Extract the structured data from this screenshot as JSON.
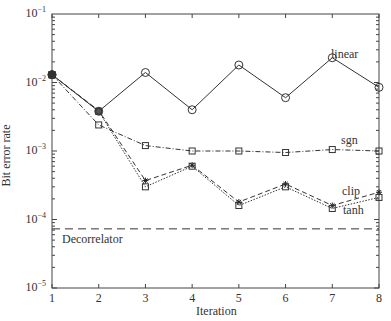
{
  "chart_data": {
    "type": "line",
    "title": "",
    "xlabel": "Iteration",
    "ylabel": "Bit error rate",
    "yscale": "log",
    "xlim": [
      1,
      8
    ],
    "ylim": [
      1e-05,
      0.1
    ],
    "grid": false,
    "legend": "inline labels",
    "x": [
      1,
      2,
      3,
      4,
      5,
      6,
      7,
      8
    ],
    "x_tick_labels": [
      "1",
      "2",
      "3",
      "4",
      "5",
      "6",
      "7",
      "8"
    ],
    "y_tick_labels": [
      {
        "base": "10",
        "exp": "−1",
        "value": 0.1
      },
      {
        "base": "10",
        "exp": "−2",
        "value": 0.01
      },
      {
        "base": "10",
        "exp": "−3",
        "value": 0.001
      },
      {
        "base": "10",
        "exp": "−4",
        "value": 0.0001
      },
      {
        "base": "10",
        "exp": "−5",
        "value": 1e-05
      }
    ],
    "series": [
      {
        "name": "linear",
        "marker": "circle",
        "style": "solid",
        "values": [
          0.013,
          0.0038,
          0.014,
          0.004,
          0.018,
          0.006,
          0.023,
          0.0085
        ]
      },
      {
        "name": "sgn",
        "marker": "square",
        "style": "dashdot",
        "values": [
          0.013,
          0.0024,
          0.0012,
          0.001,
          0.001,
          0.00095,
          0.00105,
          0.001
        ]
      },
      {
        "name": "clip",
        "marker": "star",
        "style": "dashed",
        "values": [
          0.013,
          0.0039,
          0.00037,
          0.00062,
          0.00018,
          0.00033,
          0.00016,
          0.00025
        ]
      },
      {
        "name": "tanh",
        "marker": "square",
        "style": "dotted",
        "values": [
          0.013,
          0.0038,
          0.0003,
          0.0006,
          0.00016,
          0.0003,
          0.000145,
          0.00021
        ]
      },
      {
        "name": "Decorrelator",
        "marker": "none",
        "style": "longdash",
        "values": [
          7.3e-05,
          7.3e-05,
          7.3e-05,
          7.3e-05,
          7.3e-05,
          7.3e-05,
          7.3e-05,
          7.3e-05
        ]
      }
    ],
    "annotations": [
      {
        "text": "linear",
        "series": "linear"
      },
      {
        "text": "sgn",
        "series": "sgn"
      },
      {
        "text": "clip",
        "series": "clip"
      },
      {
        "text": "tanh",
        "series": "tanh"
      },
      {
        "text": "Decorrelator",
        "series": "Decorrelator"
      }
    ]
  },
  "labels": {
    "xlabel": "Iteration",
    "ylabel": "Bit error rate",
    "linear": "linear",
    "sgn": "sgn",
    "clip": "clip",
    "tanh": "tanh",
    "decorrelator": "Decorrelator"
  }
}
